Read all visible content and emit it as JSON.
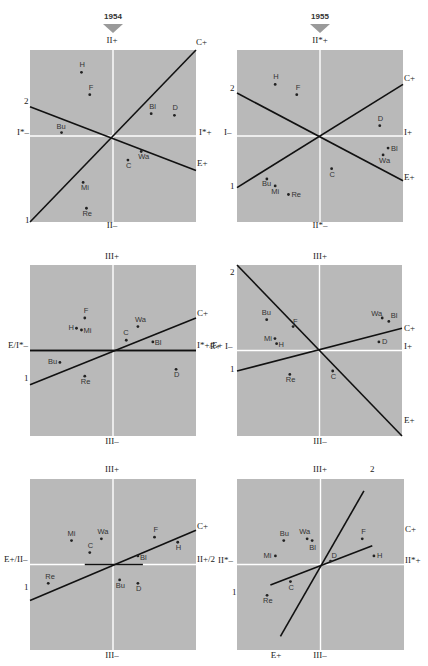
{
  "header": {
    "year_left": "1954",
    "year_right": "1955",
    "marker_color": "#9a9a9a"
  },
  "colors": {
    "panel_bg": "#b9b9b9",
    "axis_line": "#ffffff",
    "vector_line": "#111111",
    "point": "#222222"
  },
  "chart_data": [
    {
      "type": "scatter",
      "title": "1954 — I* vs II",
      "box": {
        "x": 30,
        "y": 50,
        "w": 166,
        "h": 172
      },
      "center": [
        0.5,
        0.5
      ],
      "labels": [
        {
          "text": "II+",
          "x": 112,
          "y": 40,
          "anchor": "c"
        },
        {
          "text": "II–",
          "x": 112,
          "y": 225,
          "anchor": "c"
        },
        {
          "text": "I*–",
          "x": 17,
          "y": 132,
          "anchor": "l"
        },
        {
          "text": "I*+",
          "x": 199,
          "y": 132,
          "anchor": "l"
        },
        {
          "text": "C+",
          "x": 196,
          "y": 42,
          "anchor": "l"
        },
        {
          "text": "E+",
          "x": 197,
          "y": 163,
          "anchor": "l"
        },
        {
          "text": "2",
          "x": 24,
          "y": 101,
          "anchor": "l"
        },
        {
          "text": "1",
          "x": 25,
          "y": 220,
          "anchor": "l"
        }
      ],
      "lines": [
        {
          "name": "C",
          "x1": 0.0,
          "y1": 1.0,
          "x2": 1.0,
          "y2": 0.0
        },
        {
          "name": "E",
          "x1": 0.0,
          "y1": 0.33,
          "x2": 1.0,
          "y2": 0.7
        }
      ],
      "points": [
        {
          "name": "H",
          "x": 0.31,
          "y": 0.13,
          "lx": -2,
          "ly": -5
        },
        {
          "name": "F",
          "x": 0.36,
          "y": 0.26,
          "lx": -1,
          "ly": -5
        },
        {
          "name": "Bl",
          "x": 0.73,
          "y": 0.37,
          "lx": -2,
          "ly": -5
        },
        {
          "name": "D",
          "x": 0.87,
          "y": 0.38,
          "lx": -2,
          "ly": -5
        },
        {
          "name": "Bu",
          "x": 0.19,
          "y": 0.48,
          "lx": -5,
          "ly": -4
        },
        {
          "name": "Wa",
          "x": 0.67,
          "y": 0.59,
          "lx": -3,
          "ly": 8
        },
        {
          "name": "C",
          "x": 0.59,
          "y": 0.64,
          "lx": -2,
          "ly": 8
        },
        {
          "name": "Mi",
          "x": 0.32,
          "y": 0.77,
          "lx": -2,
          "ly": 8
        },
        {
          "name": "Re",
          "x": 0.34,
          "y": 0.92,
          "lx": -4,
          "ly": 8
        }
      ]
    },
    {
      "type": "scatter",
      "title": "1955 — I vs II*",
      "box": {
        "x": 237,
        "y": 50,
        "w": 166,
        "h": 172
      },
      "center": [
        0.5,
        0.5
      ],
      "labels": [
        {
          "text": "II*+",
          "x": 320,
          "y": 40,
          "anchor": "c"
        },
        {
          "text": "II*–",
          "x": 320,
          "y": 225,
          "anchor": "c"
        },
        {
          "text": "I–",
          "x": 224,
          "y": 132,
          "anchor": "l"
        },
        {
          "text": "I+",
          "x": 404,
          "y": 132,
          "anchor": "l"
        },
        {
          "text": "C+",
          "x": 404,
          "y": 78,
          "anchor": "l"
        },
        {
          "text": "E+",
          "x": 404,
          "y": 177,
          "anchor": "l"
        },
        {
          "text": "2",
          "x": 230,
          "y": 88,
          "anchor": "l"
        },
        {
          "text": "1",
          "x": 230,
          "y": 186,
          "anchor": "l"
        }
      ],
      "lines": [
        {
          "name": "C",
          "x1": 0.0,
          "y1": 0.8,
          "x2": 1.0,
          "y2": 0.2
        },
        {
          "name": "E",
          "x1": 0.0,
          "y1": 0.25,
          "x2": 1.0,
          "y2": 0.76
        }
      ],
      "points": [
        {
          "name": "H",
          "x": 0.23,
          "y": 0.2,
          "lx": -2,
          "ly": -5
        },
        {
          "name": "F",
          "x": 0.36,
          "y": 0.26,
          "lx": -1,
          "ly": -5
        },
        {
          "name": "D",
          "x": 0.86,
          "y": 0.44,
          "lx": -2,
          "ly": -5
        },
        {
          "name": "Bl",
          "x": 0.91,
          "y": 0.57,
          "lx": 3,
          "ly": 3
        },
        {
          "name": "Wa",
          "x": 0.88,
          "y": 0.61,
          "lx": -4,
          "ly": 8
        },
        {
          "name": "C",
          "x": 0.57,
          "y": 0.69,
          "lx": -2,
          "ly": 8
        },
        {
          "name": "Bu",
          "x": 0.18,
          "y": 0.75,
          "lx": -5,
          "ly": 7
        },
        {
          "name": "Mi",
          "x": 0.23,
          "y": 0.79,
          "lx": -4,
          "ly": 8
        },
        {
          "name": "Re",
          "x": 0.31,
          "y": 0.84,
          "lx": 3,
          "ly": 3
        }
      ]
    },
    {
      "type": "scatter",
      "title": "1954 — E/I* vs III",
      "box": {
        "x": 30,
        "y": 265,
        "w": 166,
        "h": 171
      },
      "center": [
        0.5,
        0.5
      ],
      "h_axis_dark": true,
      "labels": [
        {
          "text": "III+",
          "x": 112,
          "y": 256,
          "anchor": "c"
        },
        {
          "text": "III–",
          "x": 112,
          "y": 441,
          "anchor": "c"
        },
        {
          "text": "E/I*–",
          "x": 8,
          "y": 345,
          "anchor": "l"
        },
        {
          "text": "I*+/E+",
          "x": 197,
          "y": 345,
          "anchor": "l"
        },
        {
          "text": "C+",
          "x": 197,
          "y": 313,
          "anchor": "l"
        },
        {
          "text": "1",
          "x": 24,
          "y": 378,
          "anchor": "l"
        }
      ],
      "lines": [
        {
          "name": "C",
          "x1": 0.0,
          "y1": 0.7,
          "x2": 1.0,
          "y2": 0.31
        },
        {
          "name": "E",
          "x1": 0.0,
          "y1": 0.5,
          "x2": 1.0,
          "y2": 0.5
        }
      ],
      "points": [
        {
          "name": "F",
          "x": 0.33,
          "y": 0.31,
          "lx": -1,
          "ly": -5
        },
        {
          "name": "H",
          "x": 0.28,
          "y": 0.37,
          "lx": -8,
          "ly": 2
        },
        {
          "name": "Mi",
          "x": 0.31,
          "y": 0.38,
          "lx": 2,
          "ly": 3
        },
        {
          "name": "Wa",
          "x": 0.65,
          "y": 0.36,
          "lx": -3,
          "ly": -5
        },
        {
          "name": "C",
          "x": 0.58,
          "y": 0.44,
          "lx": -3,
          "ly": -5
        },
        {
          "name": "Bl",
          "x": 0.74,
          "y": 0.45,
          "lx": 2,
          "ly": 3
        },
        {
          "name": "Bu",
          "x": 0.18,
          "y": 0.57,
          "lx": -12,
          "ly": 2
        },
        {
          "name": "Re",
          "x": 0.33,
          "y": 0.65,
          "lx": -4,
          "ly": 8
        },
        {
          "name": "D",
          "x": 0.88,
          "y": 0.61,
          "lx": -2,
          "ly": 8
        }
      ]
    },
    {
      "type": "scatter",
      "title": "1955 — I vs III",
      "box": {
        "x": 237,
        "y": 265,
        "w": 165,
        "h": 171
      },
      "center": [
        0.5,
        0.5
      ],
      "labels": [
        {
          "text": "III+",
          "x": 320,
          "y": 256,
          "anchor": "c"
        },
        {
          "text": "III–",
          "x": 320,
          "y": 441,
          "anchor": "c"
        },
        {
          "text": "E+",
          "x": 210,
          "y": 346,
          "anchor": "l"
        },
        {
          "text": "I–",
          "x": 225,
          "y": 346,
          "anchor": "l"
        },
        {
          "text": "I+",
          "x": 404,
          "y": 346,
          "anchor": "l"
        },
        {
          "text": "C+",
          "x": 404,
          "y": 328,
          "anchor": "l"
        },
        {
          "text": "E+",
          "x": 404,
          "y": 420,
          "anchor": "l"
        },
        {
          "text": "2",
          "x": 230,
          "y": 272,
          "anchor": "l"
        },
        {
          "text": "1",
          "x": 230,
          "y": 369,
          "anchor": "l"
        }
      ],
      "lines": [
        {
          "name": "C",
          "x1": 0.0,
          "y1": 0.62,
          "x2": 1.0,
          "y2": 0.37
        },
        {
          "name": "E",
          "x1": 0.0,
          "y1": 0.0,
          "x2": 1.0,
          "y2": 1.0
        }
      ],
      "points": [
        {
          "name": "Bu",
          "x": 0.18,
          "y": 0.32,
          "lx": -5,
          "ly": -5
        },
        {
          "name": "F",
          "x": 0.34,
          "y": 0.36,
          "lx": 0,
          "ly": -3
        },
        {
          "name": "Mi",
          "x": 0.23,
          "y": 0.43,
          "lx": -11,
          "ly": 2
        },
        {
          "name": "H",
          "x": 0.24,
          "y": 0.46,
          "lx": 2,
          "ly": 3
        },
        {
          "name": "Wa",
          "x": 0.88,
          "y": 0.31,
          "lx": -11,
          "ly": -2
        },
        {
          "name": "Bl",
          "x": 0.92,
          "y": 0.33,
          "lx": 2,
          "ly": -3
        },
        {
          "name": "D",
          "x": 0.86,
          "y": 0.45,
          "lx": 3,
          "ly": 2
        },
        {
          "name": "Re",
          "x": 0.32,
          "y": 0.64,
          "lx": -4,
          "ly": 8
        },
        {
          "name": "C",
          "x": 0.58,
          "y": 0.62,
          "lx": -2,
          "ly": 8
        }
      ]
    },
    {
      "type": "scatter",
      "title": "1954 — E/II vs III",
      "box": {
        "x": 30,
        "y": 479,
        "w": 166,
        "h": 171
      },
      "center": [
        0.5,
        0.5
      ],
      "extra_segment": {
        "x1": 0.33,
        "y1": 0.5,
        "x2": 0.68,
        "y2": 0.5
      },
      "labels": [
        {
          "text": "III+",
          "x": 112,
          "y": 469,
          "anchor": "c"
        },
        {
          "text": "III–",
          "x": 112,
          "y": 655,
          "anchor": "c"
        },
        {
          "text": "E+/II–",
          "x": 4,
          "y": 559,
          "anchor": "l"
        },
        {
          "text": "II+/2",
          "x": 197,
          "y": 559,
          "anchor": "l"
        },
        {
          "text": "C+",
          "x": 197,
          "y": 526,
          "anchor": "l"
        },
        {
          "text": "1",
          "x": 24,
          "y": 587,
          "anchor": "l"
        }
      ],
      "lines": [
        {
          "name": "C",
          "x1": 0.0,
          "y1": 0.71,
          "x2": 1.0,
          "y2": 0.3
        }
      ],
      "points": [
        {
          "name": "Mi",
          "x": 0.25,
          "y": 0.36,
          "lx": -4,
          "ly": -5
        },
        {
          "name": "Wa",
          "x": 0.43,
          "y": 0.35,
          "lx": -4,
          "ly": -5
        },
        {
          "name": "C",
          "x": 0.36,
          "y": 0.43,
          "lx": -2,
          "ly": -5
        },
        {
          "name": "F",
          "x": 0.75,
          "y": 0.34,
          "lx": -1,
          "ly": -5
        },
        {
          "name": "H",
          "x": 0.89,
          "y": 0.37,
          "lx": -2,
          "ly": 8
        },
        {
          "name": "Bl",
          "x": 0.65,
          "y": 0.45,
          "lx": 2,
          "ly": 4
        },
        {
          "name": "Re",
          "x": 0.11,
          "y": 0.61,
          "lx": -3,
          "ly": -4
        },
        {
          "name": "Bu",
          "x": 0.54,
          "y": 0.59,
          "lx": -4,
          "ly": 8
        },
        {
          "name": "D",
          "x": 0.65,
          "y": 0.61,
          "lx": -2,
          "ly": 8
        }
      ]
    },
    {
      "type": "scatter",
      "title": "1955 — II* vs III",
      "box": {
        "x": 237,
        "y": 479,
        "w": 167,
        "h": 171
      },
      "center": [
        0.5,
        0.5
      ],
      "labels": [
        {
          "text": "III+",
          "x": 320,
          "y": 469,
          "anchor": "c"
        },
        {
          "text": "III–",
          "x": 320,
          "y": 655,
          "anchor": "c"
        },
        {
          "text": "2",
          "x": 370,
          "y": 469,
          "anchor": "l"
        },
        {
          "text": "II*–",
          "x": 218,
          "y": 560,
          "anchor": "l"
        },
        {
          "text": "II*+",
          "x": 405,
          "y": 560,
          "anchor": "l"
        },
        {
          "text": "C+",
          "x": 405,
          "y": 529,
          "anchor": "l"
        },
        {
          "text": "1",
          "x": 232,
          "y": 592,
          "anchor": "l"
        },
        {
          "text": "E+",
          "x": 276,
          "y": 655,
          "anchor": "c"
        }
      ],
      "lines": [
        {
          "name": "long",
          "x1": 0.26,
          "y1": 0.92,
          "x2": 0.76,
          "y2": 0.07
        },
        {
          "name": "short",
          "x1": 0.2,
          "y1": 0.62,
          "x2": 0.81,
          "y2": 0.39
        }
      ],
      "points": [
        {
          "name": "Bu",
          "x": 0.28,
          "y": 0.36,
          "lx": -4,
          "ly": -5
        },
        {
          "name": "Wa",
          "x": 0.42,
          "y": 0.35,
          "lx": -8,
          "ly": -5
        },
        {
          "name": "Bl",
          "x": 0.45,
          "y": 0.36,
          "lx": -3,
          "ly": 9
        },
        {
          "name": "Mi",
          "x": 0.23,
          "y": 0.45,
          "lx": -12,
          "ly": 2
        },
        {
          "name": "D",
          "x": 0.56,
          "y": 0.48,
          "lx": 1,
          "ly": -3
        },
        {
          "name": "F",
          "x": 0.75,
          "y": 0.35,
          "lx": -1,
          "ly": -5
        },
        {
          "name": "H",
          "x": 0.82,
          "y": 0.45,
          "lx": 3,
          "ly": 2
        },
        {
          "name": "C",
          "x": 0.32,
          "y": 0.6,
          "lx": -2,
          "ly": 8
        },
        {
          "name": "Re",
          "x": 0.18,
          "y": 0.68,
          "lx": -4,
          "ly": 8
        }
      ]
    }
  ]
}
